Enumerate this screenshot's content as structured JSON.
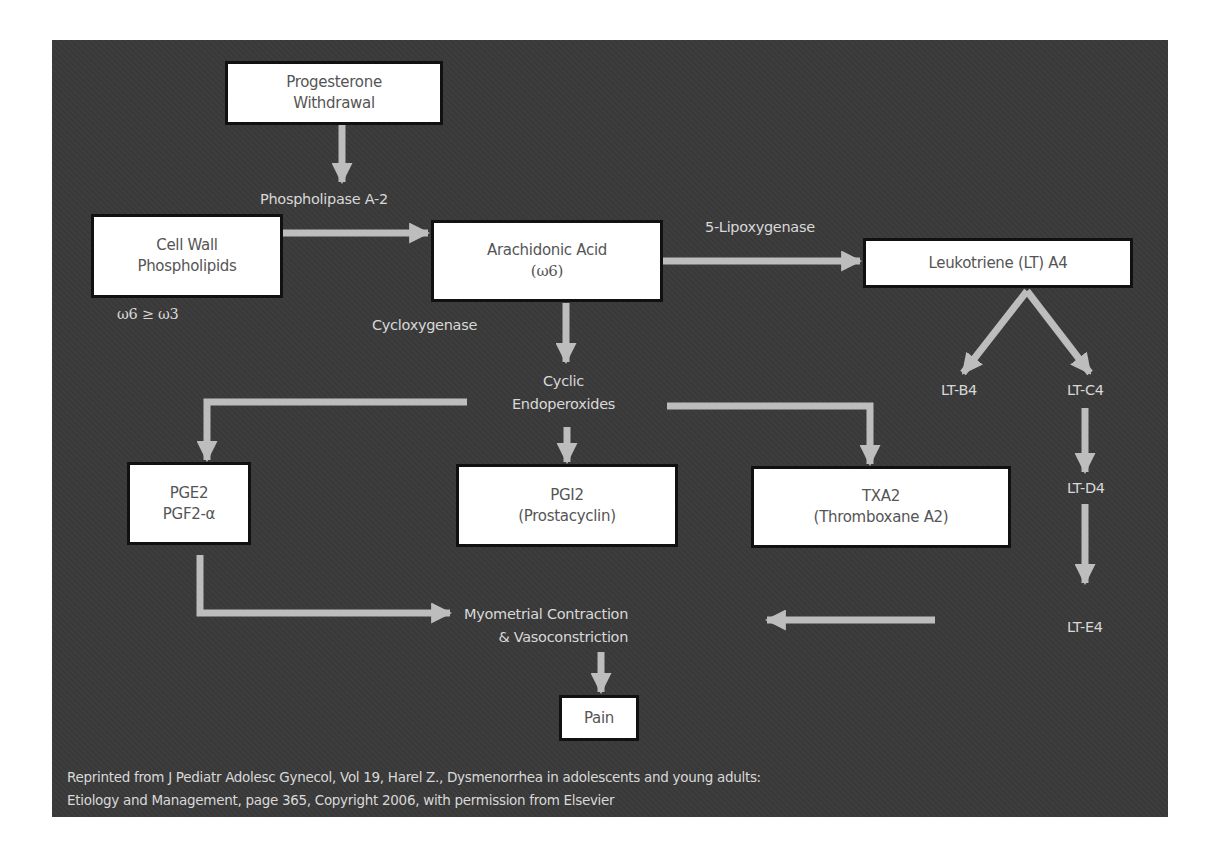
{
  "colors": {
    "panel_background": "#3a3a3a",
    "box_fill": "#ffffff",
    "box_border": "#111111",
    "arrow": "#bdbdbd",
    "label_text": "#d8d8d8",
    "box_text": "#555555"
  },
  "nodes": {
    "progesterone": {
      "line1": "Progesterone",
      "line2": "Withdrawal"
    },
    "cell_wall": {
      "line1": "Cell Wall",
      "line2": "Phospholipids"
    },
    "arachidonic": {
      "line1": "Arachidonic Acid",
      "line2": "(ω6)"
    },
    "leukotriene_a4": {
      "line1": "Leukotriene (LT) A4"
    },
    "pge2": {
      "line1": "PGE2",
      "line2": "PGF2-α"
    },
    "pgi2": {
      "line1": "PGI2",
      "line2": "(Prostacyclin)"
    },
    "txa2": {
      "line1": "TXA2",
      "line2": "(Thromboxane A2)"
    },
    "pain": {
      "line1": "Pain"
    }
  },
  "labels": {
    "phospholipase": "Phospholipase A-2",
    "omega_ratio": "ω6 ≥ ω3",
    "cyclooxygenase": "Cycloxygenase",
    "lipoxygenase": "5-Lipoxygenase",
    "cyclic_line1": "Cyclic",
    "cyclic_line2": "Endoperoxides",
    "lt_b4": "LT-B4",
    "lt_c4": "LT-C4",
    "lt_d4": "LT-D4",
    "lt_e4": "LT-E4",
    "myometrial_line1": "Myometrial Contraction",
    "myometrial_line2": "& Vasoconstriction"
  },
  "citation": {
    "line1": "Reprinted from J Pediatr Adolesc Gynecol, Vol 19, Harel Z., Dysmenorrhea in adolescents and young adults:",
    "line2": "Etiology and Management, page 365, Copyright 2006, with permission from Elsevier"
  }
}
